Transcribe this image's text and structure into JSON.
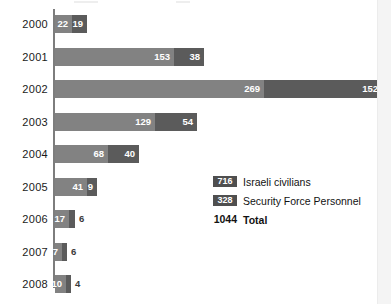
{
  "chart_data": {
    "type": "bar",
    "orientation": "horizontal",
    "stacked": true,
    "title": "",
    "subtitle": "",
    "xlabel": "",
    "ylabel": "",
    "grid": false,
    "legend_position": "inside-right",
    "categories": [
      "2000",
      "2001",
      "2002",
      "2003",
      "2004",
      "2005",
      "2006",
      "2007",
      "2008"
    ],
    "series": [
      {
        "name": "Israeli civilians",
        "color": "#828282",
        "total": 716,
        "values": [
          22,
          153,
          269,
          129,
          68,
          41,
          17,
          7,
          10
        ]
      },
      {
        "name": "Security Force Personnel",
        "color": "#5b5b5b",
        "total": 328,
        "values": [
          19,
          38,
          152,
          54,
          40,
          9,
          6,
          6,
          4
        ]
      }
    ],
    "totals_by_category": [
      41,
      191,
      421,
      183,
      108,
      50,
      23,
      13,
      14
    ],
    "grand_total": 1044,
    "xlim": [
      0,
      421
    ]
  },
  "rows": [
    {
      "year": "2000",
      "light": {
        "value": 22,
        "label": "22",
        "width_px": 17,
        "label_inside": true
      },
      "dark": {
        "value": 19,
        "label": "19",
        "width_px": 15,
        "label_inside": true
      }
    },
    {
      "year": "2001",
      "light": {
        "value": 153,
        "label": "153",
        "width_px": 119,
        "label_inside": true
      },
      "dark": {
        "value": 38,
        "label": "38",
        "width_px": 30,
        "label_inside": true
      }
    },
    {
      "year": "2002",
      "light": {
        "value": 269,
        "label": "269",
        "width_px": 209,
        "label_inside": true
      },
      "dark": {
        "value": 152,
        "label": "152",
        "width_px": 118,
        "label_inside": true
      }
    },
    {
      "year": "2003",
      "light": {
        "value": 129,
        "label": "129",
        "width_px": 100,
        "label_inside": true
      },
      "dark": {
        "value": 54,
        "label": "54",
        "width_px": 42,
        "label_inside": true
      }
    },
    {
      "year": "2004",
      "light": {
        "value": 68,
        "label": "68",
        "width_px": 53,
        "label_inside": true
      },
      "dark": {
        "value": 40,
        "label": "40",
        "width_px": 31,
        "label_inside": true
      }
    },
    {
      "year": "2005",
      "light": {
        "value": 41,
        "label": "41",
        "width_px": 32,
        "label_inside": true
      },
      "dark": {
        "value": 9,
        "label": "9",
        "width_px": 10,
        "label_inside": true
      }
    },
    {
      "year": "2006",
      "light": {
        "value": 17,
        "label": "17",
        "width_px": 14,
        "label_inside": true
      },
      "dark": {
        "value": 6,
        "label": "6",
        "width_px": 6,
        "label_inside": false
      }
    },
    {
      "year": "2007",
      "light": {
        "value": 7,
        "label": "7",
        "width_px": 7,
        "label_inside": true
      },
      "dark": {
        "value": 6,
        "label": "6",
        "width_px": 5,
        "label_inside": false
      }
    },
    {
      "year": "2008",
      "light": {
        "value": 10,
        "label": "10",
        "width_px": 11,
        "label_inside": true
      },
      "dark": {
        "value": 4,
        "label": "4",
        "width_px": 5,
        "label_inside": false
      }
    }
  ],
  "legend": {
    "civilians_count": "716",
    "civilians_label": "Israeli civilians",
    "forces_count": "328",
    "forces_label": "Security Force Personnel",
    "total_count": "1044",
    "total_label": "Total"
  },
  "colors": {
    "light_bar": "#828282",
    "dark_bar": "#5b5b5b",
    "axis": "#7d7d7d",
    "background": "#ffffff",
    "page_edge": "#f4f4f4"
  }
}
